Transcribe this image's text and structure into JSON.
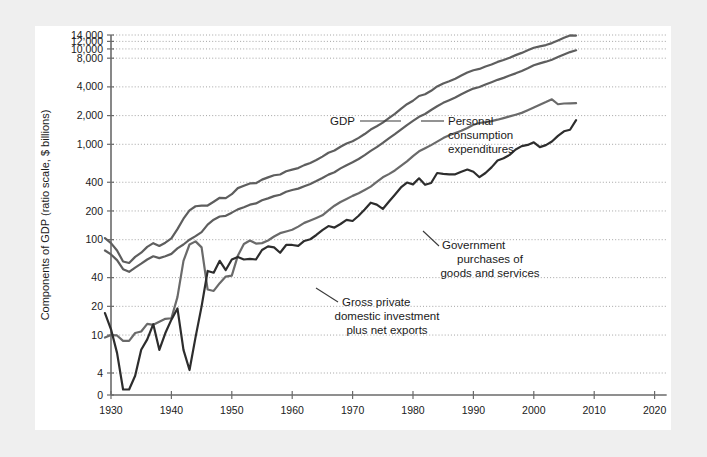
{
  "figure": {
    "background_color": "#efefef",
    "panel_color": "#ffffff"
  },
  "chart_data": {
    "type": "line",
    "title": "",
    "xlabel": "Year",
    "ylabel": "Components of GDP (ratio scale, $ billions)",
    "scale": "log (ratio scale) on y-axis",
    "grid": true,
    "legend_position": "inline annotations with leader lines",
    "xlim": [
      1928,
      2022
    ],
    "xticks": [
      1930,
      1940,
      1950,
      1960,
      1970,
      1980,
      1990,
      2000,
      2010,
      2020
    ],
    "xtick_labels": [
      "1930",
      "1940",
      "1950",
      "1960",
      "1970",
      "1980",
      "1990",
      "2000",
      "2010",
      "2020"
    ],
    "yticks": [
      0,
      4,
      10,
      20,
      40,
      100,
      200,
      400,
      1000,
      2000,
      4000,
      8000,
      10000,
      12000,
      14000
    ],
    "ytick_labels": [
      "0",
      "4",
      "10",
      "20",
      "40",
      "100",
      "200",
      "400",
      "1,000",
      "2,000",
      "4,000",
      "8,000",
      "10,000",
      "12,000",
      "14,000"
    ],
    "ylim": [
      0,
      14000
    ],
    "series": [
      {
        "name": "GDP",
        "color": "#5e5e5e",
        "annotation": "GDP",
        "x": [
          1929,
          1930,
          1931,
          1932,
          1933,
          1934,
          1935,
          1936,
          1937,
          1938,
          1939,
          1940,
          1941,
          1942,
          1943,
          1944,
          1945,
          1946,
          1947,
          1948,
          1949,
          1950,
          1951,
          1952,
          1953,
          1954,
          1955,
          1956,
          1957,
          1958,
          1959,
          1960,
          1961,
          1962,
          1963,
          1964,
          1965,
          1966,
          1967,
          1968,
          1969,
          1970,
          1971,
          1972,
          1973,
          1974,
          1975,
          1976,
          1977,
          1978,
          1979,
          1980,
          1981,
          1982,
          1983,
          1984,
          1985,
          1986,
          1987,
          1988,
          1989,
          1990,
          1991,
          1992,
          1993,
          1994,
          1995,
          1996,
          1997,
          1998,
          1999,
          2000,
          2001,
          2002,
          2003,
          2004,
          2005,
          2006,
          2007
        ],
        "y": [
          104,
          92,
          77,
          59,
          57,
          66,
          73,
          84,
          92,
          86,
          93,
          103,
          129,
          166,
          203,
          224,
          228,
          228,
          250,
          275,
          273,
          300,
          347,
          367,
          389,
          391,
          426,
          450,
          474,
          482,
          522,
          543,
          563,
          605,
          638,
          685,
          743,
          815,
          862,
          943,
          1020,
          1076,
          1168,
          1282,
          1429,
          1549,
          1689,
          1878,
          2086,
          2357,
          2632,
          2863,
          3211,
          3345,
          3638,
          4041,
          4347,
          4590,
          4870,
          5253,
          5658,
          5980,
          6174,
          6539,
          6879,
          7309,
          7664,
          8100,
          8609,
          9089,
          9661,
          10290,
          10625,
          10980,
          11512,
          12277,
          13095,
          13858,
          13810
        ]
      },
      {
        "name": "Personal consumption expenditures",
        "color": "#5e5e5e",
        "annotation": "Personal\nconsumption\nexpenditures",
        "x": [
          1929,
          1930,
          1931,
          1932,
          1933,
          1934,
          1935,
          1936,
          1937,
          1938,
          1939,
          1940,
          1941,
          1942,
          1943,
          1944,
          1945,
          1946,
          1947,
          1948,
          1949,
          1950,
          1951,
          1952,
          1953,
          1954,
          1955,
          1956,
          1957,
          1958,
          1959,
          1960,
          1961,
          1962,
          1963,
          1964,
          1965,
          1966,
          1967,
          1968,
          1969,
          1970,
          1971,
          1972,
          1973,
          1974,
          1975,
          1976,
          1977,
          1978,
          1979,
          1980,
          1981,
          1982,
          1983,
          1984,
          1985,
          1986,
          1987,
          1988,
          1989,
          1990,
          1991,
          1992,
          1993,
          1994,
          1995,
          1996,
          1997,
          1998,
          1999,
          2000,
          2001,
          2002,
          2003,
          2004,
          2005,
          2006,
          2007
        ],
        "y": [
          77,
          70,
          61,
          49,
          46,
          51,
          56,
          62,
          67,
          64,
          67,
          71,
          81,
          89,
          100,
          109,
          120,
          144,
          162,
          175,
          178,
          192,
          208,
          219,
          233,
          240,
          259,
          271,
          286,
          296,
          318,
          332,
          343,
          364,
          384,
          412,
          444,
          481,
          509,
          559,
          604,
          648,
          702,
          771,
          852,
          933,
          1034,
          1152,
          1278,
          1428,
          1592,
          1757,
          1941,
          2077,
          2290,
          2503,
          2720,
          2899,
          3100,
          3353,
          3598,
          3840,
          3986,
          4235,
          4478,
          4743,
          4976,
          5257,
          5547,
          5880,
          6282,
          6739,
          7055,
          7351,
          7709,
          8211,
          8742,
          9268,
          9680
        ]
      },
      {
        "name": "Government purchases of goods and services",
        "color": "#6a6a6a",
        "annotation": "Government\npurchases of\ngoods and services",
        "x": [
          1929,
          1930,
          1931,
          1932,
          1933,
          1934,
          1935,
          1936,
          1937,
          1938,
          1939,
          1940,
          1941,
          1942,
          1943,
          1944,
          1945,
          1946,
          1947,
          1948,
          1949,
          1950,
          1951,
          1952,
          1953,
          1954,
          1955,
          1956,
          1957,
          1958,
          1959,
          1960,
          1961,
          1962,
          1963,
          1964,
          1965,
          1966,
          1967,
          1968,
          1969,
          1970,
          1971,
          1972,
          1973,
          1974,
          1975,
          1976,
          1977,
          1978,
          1979,
          1980,
          1981,
          1982,
          1983,
          1984,
          1985,
          1986,
          1987,
          1988,
          1989,
          1990,
          1991,
          1992,
          1993,
          1994,
          1995,
          1996,
          1997,
          1998,
          1999,
          2000,
          2001,
          2002,
          2003,
          2004,
          2005,
          2006,
          2007
        ],
        "y": [
          9.4,
          10.0,
          9.9,
          8.7,
          8.7,
          10.5,
          10.9,
          13.1,
          12.8,
          13.8,
          14.8,
          15.0,
          25.0,
          60.0,
          89.0,
          96.0,
          83.0,
          30.0,
          29.0,
          35.0,
          41.0,
          42.0,
          68.0,
          90.0,
          98.0,
          91.0,
          92.0,
          98.0,
          108.0,
          117.0,
          122.0,
          127.0,
          137.0,
          150.0,
          159.0,
          169.0,
          180.0,
          203.0,
          227.0,
          248.0,
          267.0,
          288.0,
          307.0,
          332.0,
          360.0,
          403.0,
          451.0,
          487.0,
          532.0,
          594.0,
          663.0,
          753.0,
          844.0,
          909.0,
          981.0,
          1068.0,
          1162.0,
          1245.0,
          1316.0,
          1385.0,
          1483.0,
          1603.0,
          1674.0,
          1712.0,
          1752.0,
          1812.0,
          1883.0,
          1961.0,
          2044.0,
          2136.0,
          2275.0,
          2429.0,
          2600.0,
          2770.0,
          2963.0,
          2630.0,
          2680.0,
          2690.0,
          2700.0
        ]
      },
      {
        "name": "Gross private domestic investment plus net exports",
        "color": "#2d2d2d",
        "annotation": "Gross private\ndomestic investment\nplus net exports",
        "x": [
          1929,
          1930,
          1931,
          1932,
          1933,
          1934,
          1935,
          1936,
          1937,
          1938,
          1939,
          1940,
          1941,
          1942,
          1943,
          1944,
          1945,
          1946,
          1947,
          1948,
          1949,
          1950,
          1951,
          1952,
          1953,
          1954,
          1955,
          1956,
          1957,
          1958,
          1959,
          1960,
          1961,
          1962,
          1963,
          1964,
          1965,
          1966,
          1967,
          1968,
          1969,
          1970,
          1971,
          1972,
          1973,
          1974,
          1975,
          1976,
          1977,
          1978,
          1979,
          1980,
          1981,
          1982,
          1983,
          1984,
          1985,
          1986,
          1987,
          1988,
          1989,
          1990,
          1991,
          1992,
          1993,
          1994,
          1995,
          1996,
          1997,
          1998,
          1999,
          2000,
          2001,
          2002,
          2003,
          2004,
          2005,
          2006,
          2007
        ],
        "y": [
          17.0,
          11.5,
          6.5,
          1.0,
          1.0,
          3.5,
          7.0,
          9.0,
          13.0,
          7.0,
          10.5,
          14.5,
          19.0,
          7.0,
          4.3,
          9.5,
          20.0,
          47.0,
          45.0,
          60.0,
          48.0,
          62.0,
          66.0,
          62.0,
          63.0,
          62.0,
          78.0,
          85.0,
          83.0,
          73.0,
          88.0,
          88.0,
          86.0,
          97.0,
          101.0,
          112.0,
          126.0,
          139.0,
          134.0,
          146.0,
          161.0,
          157.0,
          178.0,
          207.0,
          244.0,
          233.0,
          210.0,
          250.0,
          296.0,
          353.0,
          397.0,
          380.0,
          440.0,
          376.0,
          393.0,
          500.0,
          490.0,
          484.0,
          485.0,
          516.0,
          544.0,
          515.0,
          452.0,
          500.0,
          573.0,
          677.0,
          714.0,
          775.0,
          883.0,
          957.0,
          985.0,
          1050.0,
          935.0,
          980.0,
          1070.0,
          1225.0,
          1370.0,
          1420.0,
          1790.0
        ]
      }
    ]
  },
  "annotations": [
    {
      "id": "gdp-annotation",
      "text": "GDP"
    },
    {
      "id": "pce-annotation-l1",
      "text": "Personal"
    },
    {
      "id": "pce-annotation-l2",
      "text": "consumption"
    },
    {
      "id": "pce-annotation-l3",
      "text": "expenditures"
    },
    {
      "id": "gov-annotation-l1",
      "text": "Government"
    },
    {
      "id": "gov-annotation-l2",
      "text": "purchases of"
    },
    {
      "id": "gov-annotation-l3",
      "text": "goods and services"
    },
    {
      "id": "inv-annotation-l1",
      "text": "Gross private"
    },
    {
      "id": "inv-annotation-l2",
      "text": "domestic investment"
    },
    {
      "id": "inv-annotation-l3",
      "text": "plus net exports"
    }
  ]
}
